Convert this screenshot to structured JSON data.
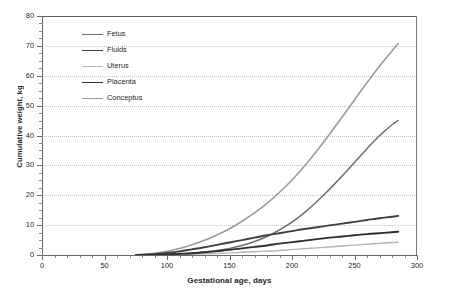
{
  "chart_data": {
    "type": "line",
    "title": "",
    "xlabel": "Gestational age, days",
    "ylabel": "Cumulative weight, kg",
    "xlim": [
      0,
      300
    ],
    "ylim": [
      0,
      80
    ],
    "xticks": [
      0,
      50,
      100,
      150,
      200,
      250,
      300
    ],
    "yticks": [
      0,
      10,
      20,
      30,
      40,
      50,
      60,
      70,
      80
    ],
    "xtick_minor_step": 10,
    "ytick_minor_step": 2.5,
    "grid": "horizontal-dotted",
    "legend_position": "upper-left-inside",
    "x": [
      75,
      90,
      100,
      110,
      120,
      130,
      140,
      150,
      160,
      170,
      180,
      190,
      200,
      210,
      220,
      230,
      240,
      250,
      260,
      270,
      280,
      285
    ],
    "series": [
      {
        "name": "Fetus",
        "color": "#6e6e6e",
        "width": 1.5,
        "values": [
          0,
          0.1,
          0.2,
          0.4,
          0.6,
          1.0,
          1.5,
          2.2,
          3.2,
          4.5,
          6.2,
          8.4,
          11.0,
          14.2,
          17.9,
          22.0,
          26.4,
          31.0,
          35.6,
          39.9,
          43.6,
          45.0
        ]
      },
      {
        "name": "Fluids",
        "color": "#404040",
        "width": 1.9,
        "values": [
          0,
          0.3,
          0.7,
          1.2,
          1.9,
          2.6,
          3.4,
          4.2,
          5.0,
          5.8,
          6.6,
          7.3,
          8.0,
          8.7,
          9.3,
          9.9,
          10.5,
          11.1,
          11.7,
          12.3,
          12.8,
          13.1
        ]
      },
      {
        "name": "Uterus",
        "color": "#b5b5b5",
        "width": 1.4,
        "values": [
          0,
          0.05,
          0.1,
          0.2,
          0.3,
          0.4,
          0.5,
          0.7,
          0.9,
          1.1,
          1.3,
          1.5,
          1.8,
          2.1,
          2.4,
          2.7,
          3.0,
          3.3,
          3.6,
          3.9,
          4.2,
          4.3
        ]
      },
      {
        "name": "Placenta",
        "color": "#2f2f2f",
        "width": 1.9,
        "values": [
          0,
          0.1,
          0.2,
          0.4,
          0.6,
          0.9,
          1.3,
          1.7,
          2.2,
          2.7,
          3.2,
          3.8,
          4.3,
          4.8,
          5.3,
          5.8,
          6.2,
          6.6,
          7.0,
          7.3,
          7.6,
          7.8
        ]
      },
      {
        "name": "Conceptus",
        "color": "#9a9a9a",
        "width": 1.6,
        "values": [
          0,
          0.6,
          1.2,
          2.2,
          3.4,
          4.9,
          6.7,
          8.8,
          11.3,
          14.1,
          17.3,
          21.0,
          25.1,
          29.8,
          34.9,
          40.4,
          46.1,
          51.9,
          57.7,
          63.2,
          68.3,
          70.8
        ]
      }
    ]
  },
  "legend": {
    "items": [
      {
        "label": "Fetus"
      },
      {
        "label": "Fluids"
      },
      {
        "label": "Uterus"
      },
      {
        "label": "Placenta"
      },
      {
        "label": "Conceptus"
      }
    ]
  },
  "colors": {
    "axis": "#6b6b6b",
    "grid": "#c2c2c2",
    "text": "#231f20",
    "background": "#ffffff"
  }
}
